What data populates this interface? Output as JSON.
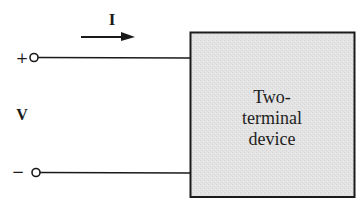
{
  "diagram": {
    "current_label": "I",
    "voltage_label": "V",
    "plus_terminal_sign": "+",
    "minus_terminal_sign": "−",
    "device": {
      "lines": [
        "Two-",
        "terminal",
        "device"
      ],
      "fill_color": "#e3e3e3",
      "border_color": "#1a1a1a"
    },
    "current_direction": "right",
    "wire_color": "#1a1a1a"
  }
}
